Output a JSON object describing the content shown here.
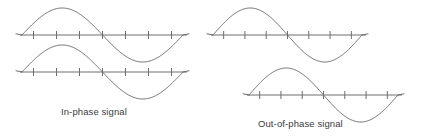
{
  "figure": {
    "title": "",
    "background_color": "#ffffff",
    "line_color": "#6e6e6e",
    "text_color": "#3b3b3b"
  },
  "captions": {
    "left": "In-phase signal",
    "right": "Out-of-phase signal"
  },
  "chart_data": {
    "type": "line",
    "xlabel": "",
    "ylabel": "",
    "grid": false,
    "legend": "none",
    "panels": [
      {
        "name": "in-phase-top",
        "caption": "In-phase signal",
        "axis": {
          "x_start_px": 22,
          "x_end_px": 183,
          "y_px": 35
        },
        "ticks": 7,
        "xlim": [
          0,
          360
        ],
        "ylim": [
          -1,
          1
        ],
        "phase_degrees": 0,
        "cycles": 1,
        "x": [
          0,
          45,
          90,
          135,
          180,
          225,
          270,
          315,
          360
        ],
        "y": [
          0,
          0.707,
          1,
          0.707,
          0,
          -0.707,
          -1,
          -0.707,
          0
        ]
      },
      {
        "name": "in-phase-bottom",
        "caption": "In-phase signal",
        "axis": {
          "x_start_px": 22,
          "x_end_px": 183,
          "y_px": 72
        },
        "ticks": 7,
        "xlim": [
          0,
          360
        ],
        "ylim": [
          -1,
          1
        ],
        "phase_degrees": 0,
        "cycles": 1,
        "x": [
          0,
          45,
          90,
          135,
          180,
          225,
          270,
          315,
          360
        ],
        "y": [
          0,
          0.707,
          1,
          0.707,
          0,
          -0.707,
          -1,
          -0.707,
          0
        ]
      },
      {
        "name": "out-of-phase-top",
        "caption": "Out-of-phase signal",
        "axis": {
          "x_start_px": 213,
          "x_end_px": 362,
          "y_px": 35
        },
        "ticks": 7,
        "xlim": [
          0,
          360
        ],
        "ylim": [
          -1,
          1
        ],
        "phase_degrees": 0,
        "cycles": 1,
        "x": [
          0,
          45,
          90,
          135,
          180,
          225,
          270,
          315,
          360
        ],
        "y": [
          0,
          0.707,
          1,
          0.707,
          0,
          -0.707,
          -1,
          -0.707,
          0
        ]
      },
      {
        "name": "out-of-phase-bottom",
        "caption": "Out-of-phase signal",
        "axis": {
          "x_start_px": 249,
          "x_end_px": 398,
          "y_px": 95
        },
        "ticks": 7,
        "xlim": [
          0,
          360
        ],
        "ylim": [
          -1,
          1
        ],
        "phase_degrees": 0,
        "cycles": 1,
        "x": [
          0,
          45,
          90,
          135,
          180,
          225,
          270,
          315,
          360
        ],
        "y": [
          0,
          0.707,
          1,
          0.707,
          0,
          -0.707,
          -1,
          -0.707,
          0
        ]
      }
    ]
  }
}
